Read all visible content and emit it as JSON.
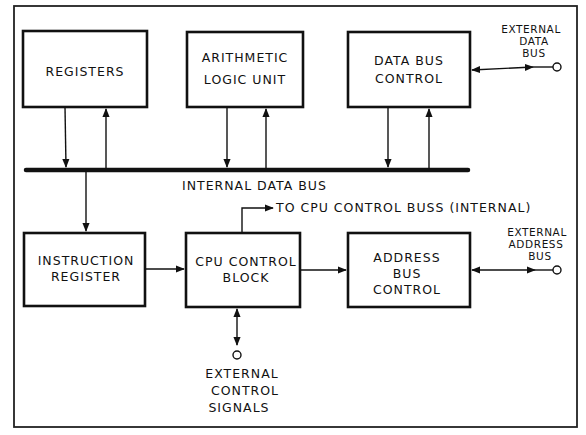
{
  "diagram": {
    "blocks": {
      "registers": {
        "lines": [
          "REGISTERS"
        ]
      },
      "alu": {
        "lines": [
          "ARITHMETIC",
          "LOGIC UNIT"
        ]
      },
      "data_bus_control": {
        "lines": [
          "DATA BUS",
          "CONTROL"
        ]
      },
      "instruction_register": {
        "lines": [
          "INSTRUCTION",
          "REGISTER"
        ]
      },
      "cpu_control_block": {
        "lines": [
          "CPU CONTROL",
          "BLOCK"
        ]
      },
      "address_bus_control": {
        "lines": [
          "ADDRESS",
          "BUS",
          "CONTROL"
        ]
      }
    },
    "labels": {
      "internal_data_bus": "INTERNAL DATA BUS",
      "to_cpu_control_bus": "TO CPU CONTROL BUSS (INTERNAL)",
      "external_data_bus": [
        "EXTERNAL",
        "DATA",
        "BUS"
      ],
      "external_address_bus": [
        "EXTERNAL",
        "ADDRESS",
        "BUS"
      ],
      "external_control_signals": [
        "EXTERNAL",
        "CONTROL",
        "SIGNALS"
      ]
    },
    "colors": {
      "ink": "#111111",
      "background": "#ffffff"
    }
  }
}
